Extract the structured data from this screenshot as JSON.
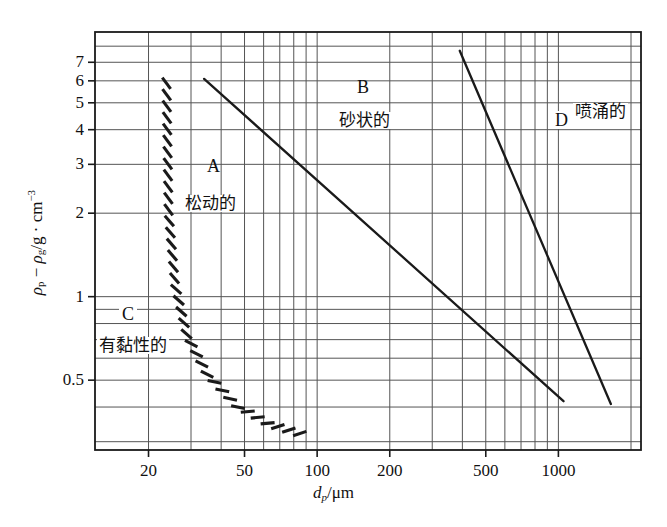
{
  "figure": {
    "name": "geldart-powder-classification-chart",
    "background_color": "#ffffff",
    "ink_color": "#1a1a1a",
    "grid_color": "#555555"
  },
  "axes": {
    "x": {
      "title_html": "d<sub>p</sub>/&mu;m",
      "title_plain": "dp/μm",
      "scale": "log",
      "range": [
        12,
        2200
      ],
      "tick_values": [
        20,
        50,
        100,
        200,
        500,
        1000
      ],
      "tick_labels": [
        "20",
        "50",
        "100",
        "200",
        "500",
        "1000"
      ],
      "gridline_values": [
        20,
        30,
        40,
        50,
        60,
        70,
        80,
        90,
        100,
        200,
        300,
        400,
        500,
        600,
        700,
        800,
        900,
        1000,
        2000
      ]
    },
    "y": {
      "title_html": "&rho;<sub>p</sub> &minus; &rho;<sub>g</sub>/g &middot; cm<sup>&minus;3</sup>",
      "title_plain": "ρp − ρg/g·cm−3",
      "scale": "log",
      "range": [
        0.28,
        9.0
      ],
      "tick_values": [
        7,
        6,
        5,
        4,
        3,
        2,
        1,
        0.5
      ],
      "tick_labels": [
        "7",
        "6",
        "5",
        "4",
        "3",
        "2",
        "1",
        "0.5"
      ],
      "gridline_values": [
        8,
        7,
        6,
        5,
        4,
        3,
        2,
        1,
        0.9,
        0.8,
        0.7,
        0.6,
        0.5,
        0.4,
        0.3
      ]
    }
  },
  "regions": [
    {
      "id": "A",
      "letter": "A",
      "name": "松动的",
      "letter_x": 207,
      "letter_y": 157,
      "name_x": 183,
      "name_y": 195
    },
    {
      "id": "B",
      "letter": "B",
      "name": "砂状的",
      "letter_x": 357,
      "letter_y": 78,
      "name_x": 337,
      "name_y": 112
    },
    {
      "id": "C",
      "letter": "C",
      "name": "有黏性的",
      "letter_x": 119,
      "letter_y": 305,
      "name_x": 97,
      "name_y": 337
    },
    {
      "id": "D",
      "letter": "D",
      "name": "喷涌的",
      "letter_x": 552,
      "letter_y": 111,
      "name_x": 573,
      "name_y": 103
    }
  ],
  "boundaries": [
    {
      "id": "ab-boundary",
      "label": "A-B boundary",
      "style": "solid",
      "points": [
        [
          34,
          6.1
        ],
        [
          1050,
          0.42
        ]
      ]
    },
    {
      "id": "bd-boundary",
      "label": "B-D boundary",
      "style": "solid",
      "points": [
        [
          390,
          7.7
        ],
        [
          1650,
          0.41
        ]
      ]
    },
    {
      "id": "ca-boundary",
      "label": "C-A boundary",
      "style": "hatched",
      "points": [
        [
          23,
          6.2
        ],
        [
          23.5,
          2.0
        ],
        [
          25,
          1.1
        ],
        [
          28,
          0.72
        ],
        [
          34,
          0.52
        ],
        [
          45,
          0.4
        ],
        [
          62,
          0.34
        ],
        [
          82,
          0.315
        ]
      ]
    }
  ],
  "chart_data": {
    "type": "line",
    "title": "",
    "subtitle": "",
    "xlabel": "dp/μm",
    "ylabel": "ρp − ρg/g·cm−3",
    "xscale": "log",
    "yscale": "log",
    "xlim": [
      12,
      2200
    ],
    "ylim": [
      0.28,
      9.0
    ],
    "xticks": [
      20,
      50,
      100,
      200,
      500,
      1000
    ],
    "xticklabels": [
      "20",
      "50",
      "100",
      "200",
      "500",
      "1000"
    ],
    "yticks": [
      7,
      6,
      5,
      4,
      3,
      2,
      1,
      0.5
    ],
    "yticklabels": [
      "7",
      "6",
      "5",
      "4",
      "3",
      "2",
      "1",
      "0.5"
    ],
    "grid": true,
    "legend": "none",
    "annotations": [
      {
        "text": "A",
        "x": 60,
        "y": 2.4
      },
      {
        "text": "松动的",
        "x": 55,
        "y": 1.55
      },
      {
        "text": "B",
        "x": 250,
        "y": 5.4
      },
      {
        "text": "砂状的",
        "x": 225,
        "y": 3.5
      },
      {
        "text": "C",
        "x": 17,
        "y": 0.5
      },
      {
        "text": "有黏性的",
        "x": 16,
        "y": 0.41
      },
      {
        "text": "D",
        "x": 1220,
        "y": 3.6
      },
      {
        "text": "喷涌的",
        "x": 1450,
        "y": 3.9
      }
    ],
    "series": [
      {
        "name": "A-B boundary",
        "style": "solid",
        "x": [
          34,
          1050
        ],
        "y": [
          6.1,
          0.42
        ]
      },
      {
        "name": "B-D boundary",
        "style": "solid",
        "x": [
          390,
          1650
        ],
        "y": [
          7.7,
          0.41
        ]
      },
      {
        "name": "C-A boundary",
        "style": "hatched",
        "x": [
          23,
          23.5,
          25,
          28,
          34,
          45,
          62,
          82
        ],
        "y": [
          6.2,
          2.0,
          1.1,
          0.72,
          0.52,
          0.4,
          0.34,
          0.315
        ]
      }
    ]
  }
}
